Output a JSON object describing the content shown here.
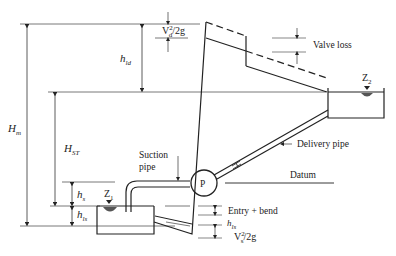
{
  "labels": {
    "valve_loss": "Valve loss",
    "delivery_pipe": "Delivery pipe",
    "suction_pipe_line1": "Suction",
    "suction_pipe_line2": "pipe",
    "datum": "Datum",
    "entry_bend": "Entry + bend",
    "pump": "P"
  },
  "symbols": {
    "Hm": {
      "main": "H",
      "sub": "m"
    },
    "HST": {
      "main": "H",
      "sub": "ST"
    },
    "hld": {
      "main": "h",
      "sub": "ld"
    },
    "hs": {
      "main": "h",
      "sub": "s"
    },
    "hls_left": {
      "main": "h",
      "sub": "ls"
    },
    "hls_right": {
      "main": "h",
      "sub": "ls"
    },
    "Z1": {
      "main": "Z",
      "sub": "1"
    },
    "Z2": {
      "main": "Z",
      "sub": "2"
    },
    "Vd": {
      "main": "V",
      "sup": "2",
      "sub": "d",
      "tail": "/2g"
    },
    "Vs": {
      "main": "V",
      "sup": "2",
      "sub": "s",
      "tail": "/2g"
    }
  },
  "colors": {
    "line": "#222222",
    "water": "#555555"
  }
}
